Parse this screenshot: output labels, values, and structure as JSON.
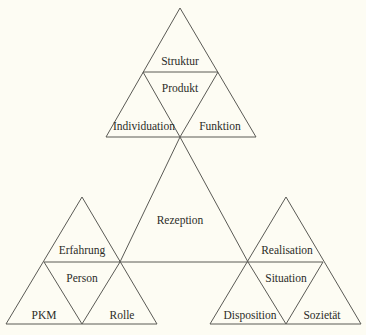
{
  "diagram": {
    "type": "triangle-of-triangles",
    "background": "#fdfcf3",
    "line_color": "#5a5a55",
    "text_color": "#2c2c28",
    "center": {
      "label": "Rezeption"
    },
    "top": {
      "top_label": "Struktur",
      "center_label": "Produkt",
      "left_label": "Individuation",
      "right_label": "Funktion"
    },
    "left": {
      "top_label": "Erfahrung",
      "center_label": "Person",
      "left_label": "PKM",
      "right_label": "Rolle"
    },
    "right": {
      "top_label": "Realisation",
      "center_label": "Situation",
      "left_label": "Disposition",
      "right_label": "Sozietät"
    }
  }
}
